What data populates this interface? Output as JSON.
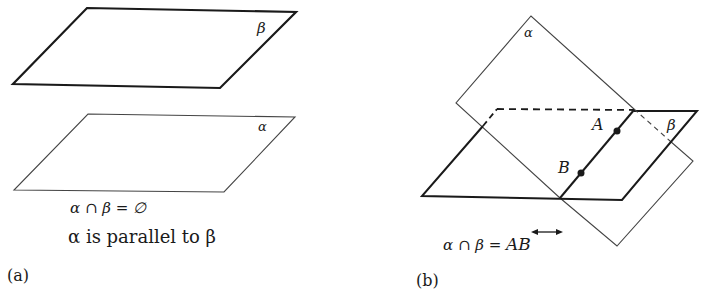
{
  "panel_a": {
    "label": "(a)",
    "plane_top_label": "β",
    "plane_bottom_label": "α",
    "equation": "α ∩ β = ∅",
    "caption": "α is parallel to β"
  },
  "panel_b": {
    "label": "(b)",
    "plane_alpha_label": "α",
    "plane_beta_label": "β",
    "point_a_label": "A",
    "point_b_label": "B",
    "equation_left": "α ∩ β = ",
    "equation_right": "AB"
  },
  "colors": {
    "line": "#1a1a1a",
    "thin": "#444444"
  }
}
